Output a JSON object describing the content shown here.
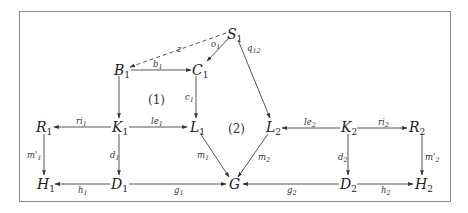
{
  "diagram": {
    "nodes": {
      "S1": {
        "base": "S",
        "sub": "1"
      },
      "B1": {
        "base": "B",
        "sub": "1"
      },
      "C1": {
        "base": "C",
        "sub": "1"
      },
      "R1": {
        "base": "R",
        "sub": "1"
      },
      "K1": {
        "base": "K",
        "sub": "1"
      },
      "L1": {
        "base": "L",
        "sub": "1"
      },
      "L2": {
        "base": "L",
        "sub": "2"
      },
      "K2": {
        "base": "K",
        "sub": "2"
      },
      "R2": {
        "base": "R",
        "sub": "2"
      },
      "H1": {
        "base": "H",
        "sub": "1"
      },
      "D1": {
        "base": "D",
        "sub": "1"
      },
      "G": {
        "base": "G",
        "sub": ""
      },
      "D2": {
        "base": "D",
        "sub": "2"
      },
      "H2": {
        "base": "H",
        "sub": "2"
      }
    },
    "edges": {
      "z": {
        "label": "z",
        "from": "S1",
        "to": "B1",
        "style": "dashed"
      },
      "o1": {
        "label": "o",
        "sub": "1",
        "from": "S1",
        "to": "C1"
      },
      "q12": {
        "label": "q",
        "sub": "12",
        "from": "S1",
        "to": "L2"
      },
      "b1": {
        "label": "b",
        "sub": "1",
        "from": "B1",
        "to": "C1"
      },
      "c1": {
        "label": "c",
        "sub": "1",
        "from": "C1",
        "to": "L1"
      },
      "B1K1": {
        "label": "",
        "from": "B1",
        "to": "K1"
      },
      "ri1": {
        "label": "ri",
        "sub": "1",
        "from": "K1",
        "to": "R1"
      },
      "le1": {
        "label": "le",
        "sub": "1",
        "from": "K1",
        "to": "L1"
      },
      "m1p": {
        "label": "m'",
        "sub": "1",
        "from": "R1",
        "to": "H1"
      },
      "d1": {
        "label": "d",
        "sub": "1",
        "from": "K1",
        "to": "D1"
      },
      "m1": {
        "label": "m",
        "sub": "1",
        "from": "L1",
        "to": "G"
      },
      "m2": {
        "label": "m",
        "sub": "2",
        "from": "L2",
        "to": "G"
      },
      "le2": {
        "label": "le",
        "sub": "2",
        "from": "K2",
        "to": "L2"
      },
      "ri2": {
        "label": "ri",
        "sub": "2",
        "from": "K2",
        "to": "R2"
      },
      "d2": {
        "label": "d",
        "sub": "2",
        "from": "K2",
        "to": "D2"
      },
      "m2p": {
        "label": "m'",
        "sub": "2",
        "from": "R2",
        "to": "H2"
      },
      "h1": {
        "label": "h",
        "sub": "1",
        "from": "D1",
        "to": "H1"
      },
      "g1": {
        "label": "g",
        "sub": "1",
        "from": "D1",
        "to": "G"
      },
      "g2": {
        "label": "g",
        "sub": "2",
        "from": "D2",
        "to": "G"
      },
      "h2": {
        "label": "h",
        "sub": "2",
        "from": "D2",
        "to": "H2"
      }
    },
    "regions": {
      "r1": "(1)",
      "r2": "(2)"
    }
  }
}
